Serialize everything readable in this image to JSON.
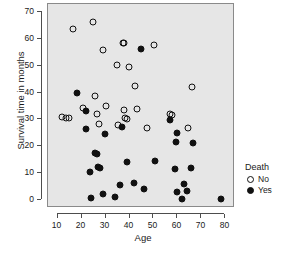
{
  "chart_data": {
    "type": "scatter",
    "title": "",
    "xlabel": "Age",
    "ylabel": "Survival time in months",
    "xlim": [
      6,
      84
    ],
    "ylim": [
      -3,
      73
    ],
    "xticks": [
      10,
      20,
      30,
      40,
      50,
      60,
      70,
      80
    ],
    "yticks": [
      0,
      10,
      20,
      30,
      40,
      50,
      60,
      70
    ],
    "grid": false,
    "legend": {
      "title": "Death",
      "position": "right",
      "entries": [
        {
          "label": "No",
          "marker": "open-circle",
          "color": "#111111"
        },
        {
          "label": "Yes",
          "marker": "filled-circle",
          "color": "#111111"
        }
      ]
    },
    "series": [
      {
        "name": "No",
        "marker": "open-circle",
        "points": [
          [
            12.0,
            30.8
          ],
          [
            13.3,
            30.6
          ],
          [
            14.6,
            30.5
          ],
          [
            16.6,
            63.8
          ],
          [
            20.4,
            34.4
          ],
          [
            24.8,
            66.2
          ],
          [
            25.5,
            38.6
          ],
          [
            26.6,
            32.2
          ],
          [
            27.4,
            28.4
          ],
          [
            28.8,
            55.9
          ],
          [
            30.0,
            34.9
          ],
          [
            34.6,
            50.4
          ],
          [
            35.2,
            28.0
          ],
          [
            37.2,
            58.5
          ],
          [
            37.9,
            58.6
          ],
          [
            37.5,
            33.6
          ],
          [
            38.1,
            30.4
          ],
          [
            38.8,
            30.2
          ],
          [
            39.9,
            49.4
          ],
          [
            42.3,
            42.3
          ],
          [
            43.0,
            33.8
          ],
          [
            47.1,
            26.7
          ],
          [
            50.4,
            57.7
          ],
          [
            57.0,
            32.0
          ],
          [
            57.6,
            31.8
          ],
          [
            64.2,
            26.7
          ],
          [
            66.0,
            42.0
          ]
        ]
      },
      {
        "name": "Yes",
        "marker": "filled-circle",
        "points": [
          [
            18.1,
            39.8
          ],
          [
            21.7,
            33.1
          ],
          [
            22.0,
            26.5
          ],
          [
            23.6,
            10.3
          ],
          [
            24.1,
            0.7
          ],
          [
            25.6,
            17.4
          ],
          [
            26.3,
            17.0
          ],
          [
            26.7,
            12.3
          ],
          [
            27.7,
            11.9
          ],
          [
            28.9,
            2.3
          ],
          [
            29.7,
            24.7
          ],
          [
            33.8,
            1.0
          ],
          [
            35.9,
            5.5
          ],
          [
            36.9,
            27.0
          ],
          [
            39.1,
            14.3
          ],
          [
            41.8,
            6.3
          ],
          [
            44.6,
            56.2
          ],
          [
            46.0,
            3.9
          ],
          [
            50.5,
            14.6
          ],
          [
            57.0,
            29.6
          ],
          [
            58.9,
            11.6
          ],
          [
            59.3,
            21.5
          ],
          [
            59.7,
            24.9
          ],
          [
            59.8,
            3.1
          ],
          [
            62.0,
            0.3
          ],
          [
            62.8,
            6.1
          ],
          [
            64.0,
            3.4
          ],
          [
            65.6,
            11.9
          ],
          [
            66.3,
            21.1
          ],
          [
            78.0,
            0.4
          ]
        ]
      }
    ]
  }
}
